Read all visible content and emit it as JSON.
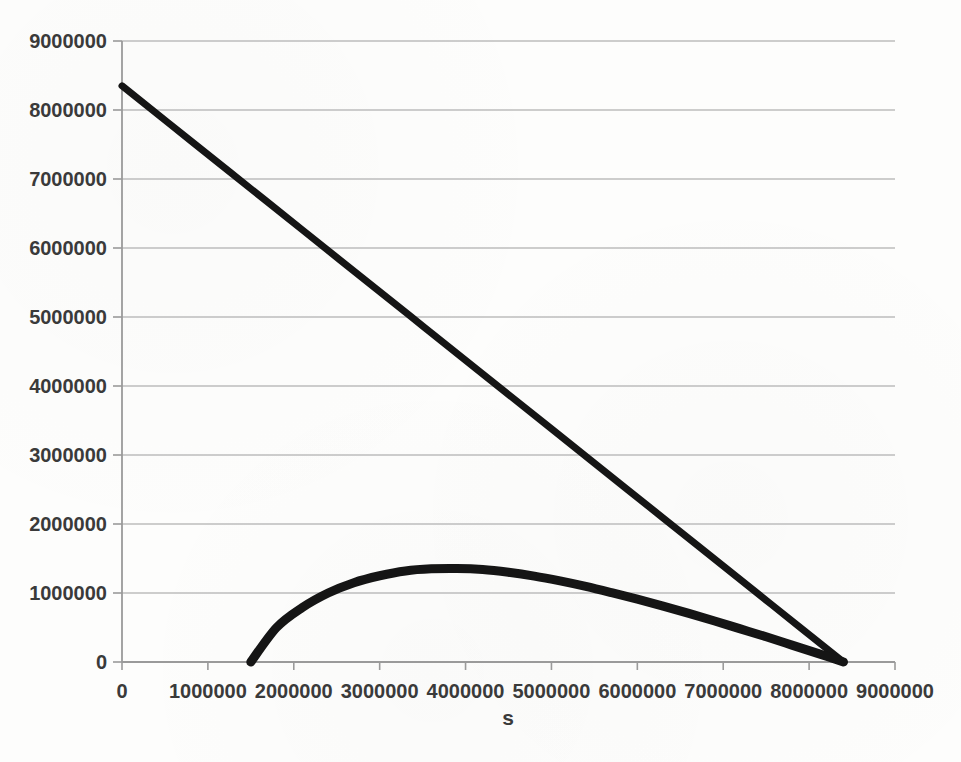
{
  "chart_data": {
    "type": "line",
    "title": "",
    "xlabel": "s",
    "ylabel": "",
    "xlim": [
      0,
      9000000
    ],
    "ylim": [
      0,
      9000000
    ],
    "grid": true,
    "grid_axis": "y",
    "legend": "none",
    "xticks": [
      0,
      1000000,
      2000000,
      3000000,
      4000000,
      5000000,
      6000000,
      7000000,
      8000000,
      9000000
    ],
    "xtick_labels": [
      "0",
      "1000000",
      "2000000",
      "3000000",
      "4000000",
      "5000000",
      "6000000",
      "7000000",
      "8000000",
      "9000000"
    ],
    "yticks": [
      0,
      1000000,
      2000000,
      3000000,
      4000000,
      5000000,
      6000000,
      7000000,
      8000000,
      9000000
    ],
    "ytick_labels": [
      "0",
      "1000000",
      "2000000",
      "3000000",
      "4000000",
      "5000000",
      "6000000",
      "7000000",
      "8000000",
      "9000000"
    ],
    "series": [
      {
        "name": "descending-line",
        "style": "solid",
        "color": "#151515",
        "linewidth": 7,
        "x": [
          0,
          840000,
          1680000,
          2520000,
          3360000,
          4200000,
          5040000,
          5880000,
          6720000,
          7560000,
          8400000
        ],
        "values": [
          8350000,
          7515000,
          6680000,
          5845000,
          5010000,
          4175000,
          3340000,
          2505000,
          1670000,
          835000,
          0
        ]
      },
      {
        "name": "concave-arc",
        "style": "solid",
        "color": "#151515",
        "linewidth": 9,
        "x": [
          1500000,
          1800000,
          2100000,
          2400000,
          2700000,
          3000000,
          3300000,
          3600000,
          3900000,
          4200000,
          4500000,
          4800000,
          5100000,
          5400000,
          5700000,
          6000000,
          6300000,
          6600000,
          6900000,
          7200000,
          7500000,
          7800000,
          8100000,
          8400000
        ],
        "values": [
          0,
          500000,
          790000,
          1000000,
          1150000,
          1250000,
          1320000,
          1350000,
          1355000,
          1340000,
          1300000,
          1245000,
          1175000,
          1095000,
          1005000,
          910000,
          810000,
          705000,
          595000,
          480000,
          365000,
          245000,
          125000,
          0
        ]
      }
    ],
    "colors": {
      "background": "#fdfdfc",
      "gridline": "#bcbcbc",
      "axis": "#9a9a9a",
      "tick_text": "#3a3a3a",
      "data": "#151515"
    }
  }
}
